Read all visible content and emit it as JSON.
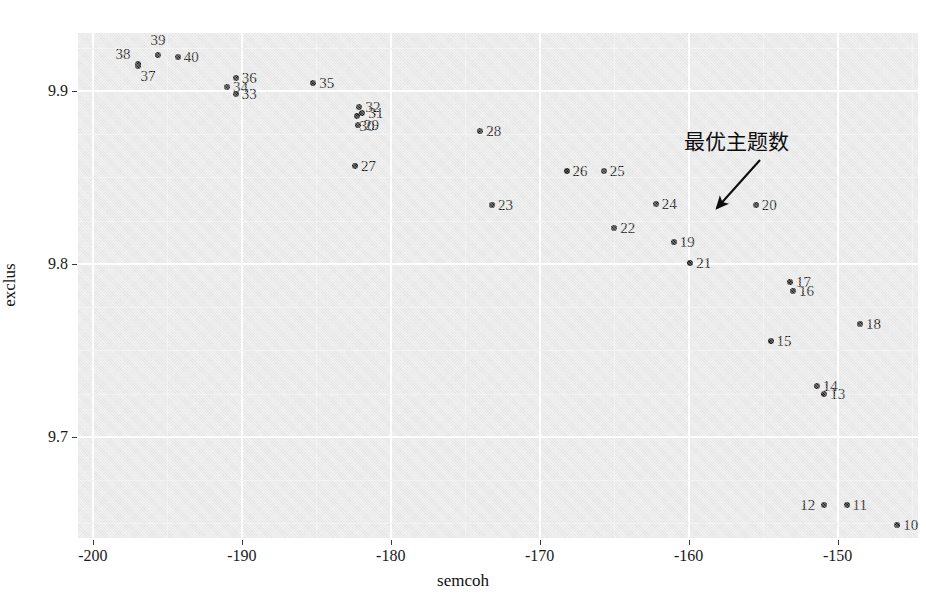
{
  "chart_data": {
    "type": "scatter",
    "title": "",
    "xlabel": "semcoh",
    "ylabel": "exclus",
    "xlim": [
      -201.0,
      -144.6
    ],
    "ylim": [
      9.6415,
      9.9335
    ],
    "xticks": [
      -200,
      -190,
      -180,
      -170,
      -160,
      -150
    ],
    "xtick_labels": [
      "-200",
      "-190",
      "-180",
      "-170",
      "-160",
      "-150"
    ],
    "yticks": [
      9.9,
      9.8,
      9.7
    ],
    "ytick_labels": [
      "9.9",
      "9.8",
      "9.7"
    ],
    "grid": true,
    "grid_color": "#ffffff",
    "panel_background": "#e9e9e9",
    "point_color": "#1a1a1a",
    "legend": "none",
    "points": [
      {
        "label": "40",
        "x": -194.3,
        "y": 9.9195,
        "label_pos": "right"
      },
      {
        "label": "39",
        "x": -195.6,
        "y": 9.9205,
        "label_pos": "above"
      },
      {
        "label": "38",
        "x": -197.0,
        "y": 9.9155,
        "label_pos": "upper-left"
      },
      {
        "label": "37",
        "x": -197.0,
        "y": 9.9145,
        "label_pos": "below-right"
      },
      {
        "label": "36",
        "x": -190.4,
        "y": 9.9075,
        "label_pos": "right"
      },
      {
        "label": "35",
        "x": -185.2,
        "y": 9.9045,
        "label_pos": "right"
      },
      {
        "label": "34",
        "x": -191.0,
        "y": 9.9025,
        "label_pos": "right"
      },
      {
        "label": "33",
        "x": -190.4,
        "y": 9.8985,
        "label_pos": "right"
      },
      {
        "label": "32",
        "x": -182.1,
        "y": 9.8905,
        "label_pos": "right"
      },
      {
        "label": "31",
        "x": -181.9,
        "y": 9.8875,
        "label_pos": "right"
      },
      {
        "label": "30",
        "x": -182.3,
        "y": 9.8855,
        "label_pos": "below-right"
      },
      {
        "label": "29",
        "x": -182.2,
        "y": 9.8805,
        "label_pos": "right"
      },
      {
        "label": "28",
        "x": -174.0,
        "y": 9.877,
        "label_pos": "right"
      },
      {
        "label": "27",
        "x": -182.4,
        "y": 9.8565,
        "label_pos": "right"
      },
      {
        "label": "26",
        "x": -168.2,
        "y": 9.8535,
        "label_pos": "right"
      },
      {
        "label": "25",
        "x": -165.7,
        "y": 9.8535,
        "label_pos": "right"
      },
      {
        "label": "24",
        "x": -162.2,
        "y": 9.8345,
        "label_pos": "right"
      },
      {
        "label": "23",
        "x": -173.2,
        "y": 9.834,
        "label_pos": "right"
      },
      {
        "label": "22",
        "x": -165.0,
        "y": 9.8205,
        "label_pos": "right"
      },
      {
        "label": "21",
        "x": -159.9,
        "y": 9.8005,
        "label_pos": "right"
      },
      {
        "label": "20",
        "x": -155.5,
        "y": 9.834,
        "label_pos": "right"
      },
      {
        "label": "19",
        "x": -161.0,
        "y": 9.8125,
        "label_pos": "right"
      },
      {
        "label": "18",
        "x": -148.5,
        "y": 9.7655,
        "label_pos": "right"
      },
      {
        "label": "17",
        "x": -153.2,
        "y": 9.7895,
        "label_pos": "right"
      },
      {
        "label": "16",
        "x": -153.0,
        "y": 9.7845,
        "label_pos": "right"
      },
      {
        "label": "15",
        "x": -154.5,
        "y": 9.7555,
        "label_pos": "right"
      },
      {
        "label": "14",
        "x": -151.4,
        "y": 9.7295,
        "label_pos": "right"
      },
      {
        "label": "13",
        "x": -150.9,
        "y": 9.7245,
        "label_pos": "right"
      },
      {
        "label": "12",
        "x": -150.9,
        "y": 9.6605,
        "label_pos": "left"
      },
      {
        "label": "11",
        "x": -149.4,
        "y": 9.6605,
        "label_pos": "right"
      },
      {
        "label": "10",
        "x": -146.0,
        "y": 9.649,
        "label_pos": "right"
      }
    ],
    "annotations": [
      {
        "text": "最优主题数",
        "target_label": "20",
        "arrow": true,
        "text_x": -153.0,
        "text_y": 9.8675
      }
    ]
  }
}
